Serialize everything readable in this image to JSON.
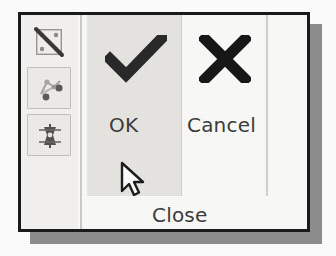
{
  "panel": {
    "name": "confirm-toolbar-panel",
    "background_color": "#fbfbfa",
    "border_color": "#1b1b1b",
    "shadow_color": "#8e8e8e"
  },
  "icon_rail": {
    "background_color": "#f4f3f1",
    "items": [
      {
        "icon": "no-selection-slashed-icon",
        "framed": false,
        "pressed": false
      },
      {
        "icon": "node-points-select-icon",
        "framed": true,
        "pressed": true
      },
      {
        "icon": "element-mesh-icon",
        "framed": true,
        "pressed": true
      }
    ]
  },
  "actions": {
    "highlight_color": "#e7e6e3",
    "ok": {
      "icon": "checkmark-icon",
      "label": "OK",
      "color": "#3c3c3c",
      "highlighted": true
    },
    "cancel": {
      "icon": "x-cross-icon",
      "label": "Cancel",
      "color": "#3c3c3c",
      "highlighted": false
    },
    "close": {
      "label": "Close",
      "color": "#3c3c3c"
    }
  },
  "cursor": {
    "icon": "mouse-pointer-arrow-icon",
    "x": 98,
    "y": 146
  }
}
